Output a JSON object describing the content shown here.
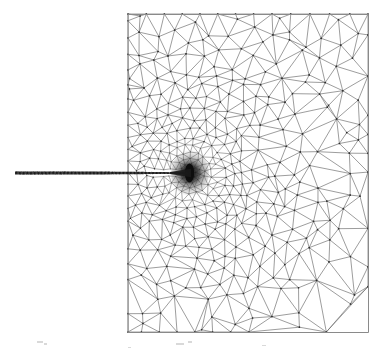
{
  "figure": {
    "kind": "finite-element-mesh-diagram",
    "background_color": "#ffffff",
    "canvas_width": 389,
    "canvas_height": 350
  },
  "chart_data": {
    "type": "diagram",
    "subtype": "finite-element-mesh",
    "xlabel": "",
    "ylabel": "",
    "grid": false,
    "legend": null,
    "annotations": [],
    "domain": {
      "name": "rectangular-plate",
      "shape": "rectangle",
      "x0": 128,
      "y0": 14,
      "x1": 368,
      "y1": 332,
      "width_px": 240,
      "height_px": 318,
      "edge_color": "#8a8a8a",
      "edge_width": 1.0
    },
    "crack": {
      "name": "horizontal-edge-crack",
      "x_start": 15,
      "x_tip": 190,
      "y": 173,
      "thickness_px": 3.2,
      "color": "#1a1a1a",
      "enters_domain_at_x": 128
    },
    "crack_tip": {
      "x": 190,
      "y": 173,
      "refinement": "extreme",
      "core_radius_px": 9,
      "core_color": "#0d0d0d"
    },
    "mesh": {
      "element_type": "triangle",
      "grading": "radial-refinement-toward-crack-tip",
      "coarse_edge_length_px": 22,
      "fine_edge_length_px": 0.6,
      "grading_exponent": 2.1,
      "line_color": "#5a5a5a",
      "line_width": 0.65,
      "node_color": "#2e2e2e",
      "node_radius_px": 0.85,
      "approx_node_count": 2400,
      "approx_element_count": 4600,
      "rings": 46,
      "ring_radii_px": [
        1.2,
        1.8,
        2.6,
        3.6,
        4.9,
        6.5,
        8.4,
        10.7,
        13.4,
        16.6,
        20.3,
        24.6,
        29.5,
        35.1,
        41.4,
        48.5,
        56.4,
        65.2,
        74.9,
        85.6,
        97.3,
        110.1,
        124.0,
        139.1,
        155.4,
        173.0
      ]
    },
    "noise_specks": [
      {
        "x": 37,
        "y": 341,
        "w": 6,
        "h": 2
      },
      {
        "x": 44,
        "y": 343,
        "w": 3,
        "h": 2
      },
      {
        "x": 176,
        "y": 343,
        "w": 8,
        "h": 2
      },
      {
        "x": 188,
        "y": 341,
        "w": 4,
        "h": 2
      },
      {
        "x": 128,
        "y": 347,
        "w": 3,
        "h": 1
      },
      {
        "x": 262,
        "y": 345,
        "w": 4,
        "h": 1
      }
    ]
  }
}
